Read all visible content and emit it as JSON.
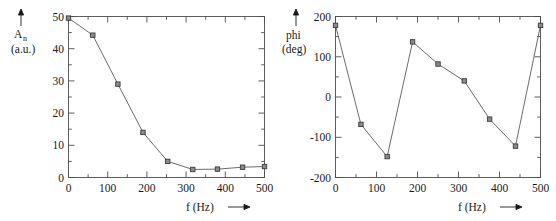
{
  "figure": {
    "background_color": "#ffffff",
    "line_color": "#5a5a5a",
    "axis_color": "#4d4d4d",
    "text_color": "#1a1a1a"
  },
  "panels": {
    "amplitude": {
      "y_axis_arrow": "↑",
      "y_label_main": "A",
      "y_label_subscript": "n",
      "y_label_units": "(a.u.)",
      "x_label": "f (Hz)",
      "x_label_arrow": "⟶",
      "y_ticks": [
        "0",
        "10",
        "20",
        "30",
        "40",
        "50"
      ],
      "x_ticks": [
        "0",
        "100",
        "200",
        "300",
        "400",
        "500"
      ]
    },
    "phase": {
      "y_axis_arrow": "↑",
      "y_label_main": "phi",
      "y_label_units": "(deg)",
      "x_label": "f (Hz)",
      "x_label_arrow": "⟶",
      "y_ticks": [
        "-200",
        "-100",
        "0",
        "100",
        "200"
      ],
      "x_ticks": [
        "0",
        "100",
        "200",
        "300",
        "400",
        "500"
      ]
    }
  },
  "chart_data": [
    {
      "type": "line",
      "title": "",
      "xlabel": "f (Hz)",
      "ylabel": "A_n (a.u.)",
      "xlim": [
        0,
        500
      ],
      "ylim": [
        0,
        50
      ],
      "xticks": [
        0,
        100,
        200,
        300,
        400,
        500
      ],
      "yticks": [
        0,
        10,
        20,
        30,
        40,
        50
      ],
      "minor_ticks": true,
      "grid": false,
      "legend": "none",
      "markers": "filled-square",
      "x": [
        0,
        62,
        126,
        190,
        253,
        317,
        380,
        444,
        500
      ],
      "values": [
        49.5,
        44.2,
        29.0,
        14.0,
        5.0,
        2.5,
        2.6,
        3.2,
        3.4
      ]
    },
    {
      "type": "line",
      "title": "",
      "xlabel": "f (Hz)",
      "ylabel": "phi (deg)",
      "xlim": [
        0,
        500
      ],
      "ylim": [
        -200,
        200
      ],
      "xticks": [
        0,
        100,
        200,
        300,
        400,
        500
      ],
      "yticks": [
        -200,
        -100,
        0,
        100,
        200
      ],
      "minor_ticks": true,
      "grid": false,
      "legend": "none",
      "markers": "filled-square",
      "x": [
        0,
        62,
        126,
        188,
        250,
        314,
        376,
        439,
        500
      ],
      "values": [
        178,
        -68,
        -148,
        137,
        82,
        40,
        -55,
        -122,
        178
      ]
    }
  ]
}
